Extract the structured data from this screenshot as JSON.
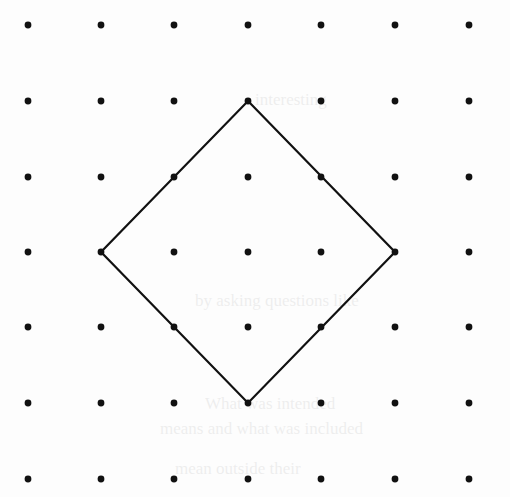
{
  "diagram": {
    "type": "dot-grid-with-polygon",
    "background_color": "#fdfdfd",
    "ink_color": "#111111",
    "grid": {
      "columns": 7,
      "rows": 7,
      "x_positions": [
        28,
        101,
        174,
        248,
        321,
        395,
        469
      ],
      "y_positions": [
        25,
        101,
        177,
        252,
        327,
        403,
        479
      ],
      "dot_radius": 3.4
    },
    "polygon": {
      "shape": "square (rotated 45°)",
      "stroke_width": 2.2,
      "vertices_grid_index": [
        {
          "col": 3,
          "row": 1,
          "label": "top"
        },
        {
          "col": 5,
          "row": 3,
          "label": "right"
        },
        {
          "col": 3,
          "row": 5,
          "label": "bottom"
        },
        {
          "col": 1,
          "row": 3,
          "label": "left"
        }
      ]
    },
    "ghost_bleed_through": [
      {
        "text": "interesting",
        "x": 255,
        "y": 104
      },
      {
        "text": "by asking questions like",
        "x": 195,
        "y": 305
      },
      {
        "text": "What was intended",
        "x": 205,
        "y": 408
      },
      {
        "text": "means and what was included",
        "x": 160,
        "y": 433
      },
      {
        "text": "mean outside their",
        "x": 175,
        "y": 473
      }
    ]
  }
}
